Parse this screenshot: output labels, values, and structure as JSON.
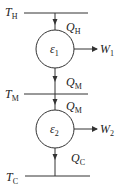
{
  "diagram": {
    "reservoirs": [
      {
        "id": "hot",
        "symbol": "T",
        "subscript": "H"
      },
      {
        "id": "middle",
        "symbol": "T",
        "subscript": "M"
      },
      {
        "id": "cold",
        "symbol": "T",
        "subscript": "C"
      }
    ],
    "engines": [
      {
        "id": "engine1",
        "symbol": "ε",
        "subscript": "1"
      },
      {
        "id": "engine2",
        "symbol": "ε",
        "subscript": "2"
      }
    ],
    "heat_flows": [
      {
        "id": "qh",
        "symbol": "Q",
        "subscript": "H"
      },
      {
        "id": "qm1",
        "symbol": "Q",
        "subscript": "M"
      },
      {
        "id": "qm2",
        "symbol": "Q",
        "subscript": "M"
      },
      {
        "id": "qc",
        "symbol": "Q",
        "subscript": "C"
      }
    ],
    "work_outputs": [
      {
        "id": "w1",
        "symbol": "W",
        "subscript": "1"
      },
      {
        "id": "w2",
        "symbol": "W",
        "subscript": "2"
      }
    ],
    "colors": {
      "stroke": "#333333",
      "background": "#ffffff"
    }
  }
}
